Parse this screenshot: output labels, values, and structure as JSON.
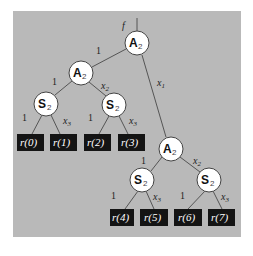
{
  "diagram": {
    "function_label": "f",
    "panel_color": "#b9b9b9",
    "nodes": [
      {
        "id": "root",
        "type": "A",
        "sub": "2",
        "cx": 137,
        "cy": 43
      },
      {
        "id": "a-left",
        "type": "A",
        "sub": "2",
        "cx": 81,
        "cy": 73
      },
      {
        "id": "s-ll",
        "type": "S",
        "sub": "2",
        "cx": 46,
        "cy": 104
      },
      {
        "id": "s-lr",
        "type": "S",
        "sub": "2",
        "cx": 114,
        "cy": 105
      },
      {
        "id": "a-right",
        "type": "A",
        "sub": "2",
        "cx": 171,
        "cy": 149
      },
      {
        "id": "s-rl",
        "type": "S",
        "sub": "2",
        "cx": 142,
        "cy": 180
      },
      {
        "id": "s-rr",
        "type": "S",
        "sub": "2",
        "cx": 209,
        "cy": 180
      }
    ],
    "leaves": [
      {
        "label": "r(0)",
        "x": 17,
        "y": 134
      },
      {
        "label": "r(1)",
        "x": 51,
        "y": 134
      },
      {
        "label": "r(2)",
        "x": 84,
        "y": 134
      },
      {
        "label": "r(3)",
        "x": 118,
        "y": 134
      },
      {
        "label": "r(4)",
        "x": 110,
        "y": 209
      },
      {
        "label": "r(5)",
        "x": 140,
        "y": 209
      },
      {
        "label": "r(6)",
        "x": 174,
        "y": 209
      },
      {
        "label": "r(7)",
        "x": 208,
        "y": 209
      }
    ],
    "edge_labels": {
      "root_left": "1",
      "root_right_var": "x",
      "root_right_sub": "1",
      "aleft_left": "1",
      "aleft_right_var": "x",
      "aleft_right_sub": "2",
      "sll_left": "1",
      "sll_right_var": "x",
      "sll_right_sub": "3",
      "slr_left": "1",
      "slr_right_var": "x",
      "slr_right_sub": "3",
      "aright_left": "1",
      "aright_right_var": "x",
      "aright_right_sub": "2",
      "srl_left": "1",
      "srl_right_var": "x",
      "srl_right_sub": "3",
      "srr_left": "1",
      "srr_right_var": "x",
      "srr_right_sub": "3"
    },
    "node_text": {
      "A": "A",
      "S": "S",
      "sub": "2"
    }
  }
}
